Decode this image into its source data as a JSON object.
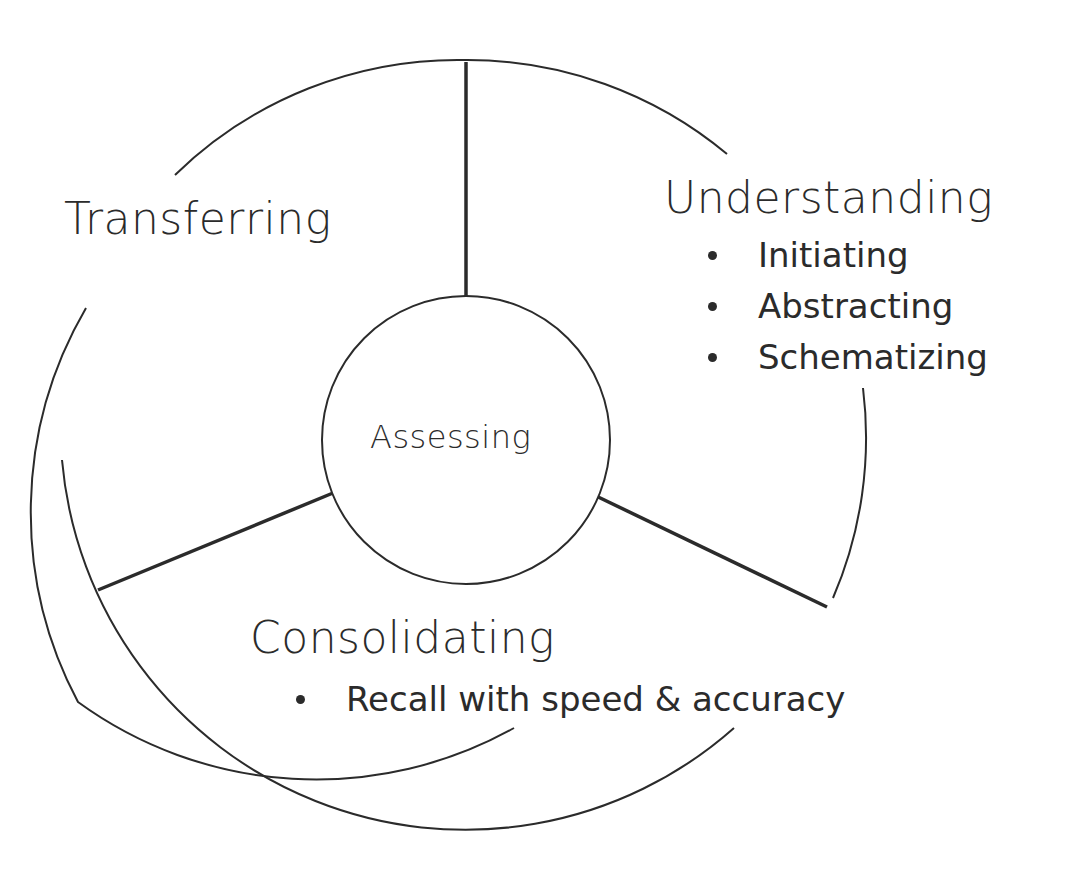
{
  "diagram": {
    "center": {
      "label": "Assessing"
    },
    "segments": [
      {
        "id": "transferring",
        "title": "Transferring",
        "items": []
      },
      {
        "id": "understanding",
        "title": "Understanding",
        "items": [
          "Initiating",
          "Abstracting",
          "Schematizing"
        ]
      },
      {
        "id": "consolidating",
        "title": "Consolidating",
        "items": [
          "Recall with speed & accuracy"
        ]
      }
    ],
    "colors": {
      "stroke": "#2b2b2b",
      "background": "#ffffff"
    }
  }
}
